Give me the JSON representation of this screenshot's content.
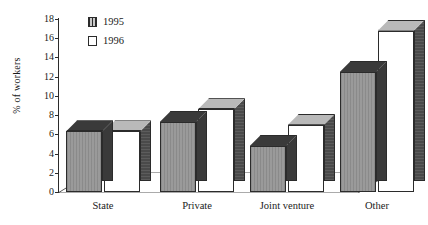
{
  "chart_data": {
    "type": "bar",
    "title": "",
    "subtitle": "",
    "xlabel": "",
    "ylabel": "% of workers",
    "ylim": [
      0,
      18
    ],
    "ytick_step": 2,
    "yticks": [
      18,
      16,
      14,
      12,
      10,
      8,
      6,
      4,
      2,
      0
    ],
    "grid": false,
    "legend_position": "top-left",
    "style": "3d-column",
    "categories": [
      "State",
      "Private",
      "Joint venture",
      "Other"
    ],
    "series": [
      {
        "name": "1995",
        "values": [
          6.3,
          7.3,
          4.8,
          12.5
        ],
        "color": "#9a9a9a"
      },
      {
        "name": "1996",
        "values": [
          6.3,
          8.6,
          7.0,
          16.8
        ],
        "color": "#ffffff"
      }
    ]
  },
  "legend": {
    "items": [
      {
        "label": "1995",
        "swatch": "hatched-grey"
      },
      {
        "label": "1996",
        "swatch": "white"
      }
    ]
  },
  "colors": {
    "axis": "#2b2b2b",
    "series_1995_front": "#9a9a9a",
    "series_1995_side": "#3a3a3a",
    "series_1996_front": "#ffffff",
    "series_1996_side": "#4a4a4a",
    "background": "#ffffff"
  }
}
